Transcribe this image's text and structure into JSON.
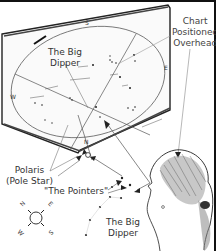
{
  "figure": {
    "labels": {
      "chart_positioned": [
        "Chart",
        "Positioned",
        "Overhead"
      ],
      "big_dipper_on_chart": [
        "The Big",
        "Dipper"
      ],
      "polaris": [
        "Polaris",
        "(Pole Star)"
      ],
      "pointers": "\"The Pointers\"",
      "big_dipper_sky": [
        "The Big",
        "Dipper"
      ]
    },
    "chart_directions": {
      "north": "N",
      "south": "S",
      "east": "E",
      "west": "W"
    },
    "compass": {
      "north": "N",
      "east": "E",
      "south": "S",
      "west": "W"
    },
    "colors": {
      "ink": "#222222",
      "line": "#555555",
      "background": "#ffffff"
    }
  }
}
